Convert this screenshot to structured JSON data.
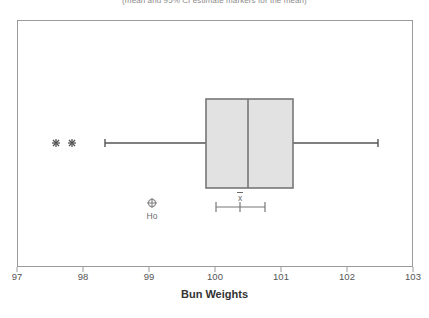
{
  "subtitle": "(mean and 95% CI estimate markers for the mean)",
  "axis": {
    "title": "Bun Weights",
    "ticks": [
      "97",
      "98",
      "99",
      "100",
      "101",
      "102",
      "103"
    ]
  },
  "annotations": {
    "ho_label": "Ho",
    "xbar_label": "x"
  },
  "colors": {
    "frame": "#9a9a9a",
    "box_fill": "#e2e2e2",
    "box_border": "#777777",
    "whisker": "#555555",
    "outlier": "#555555",
    "marker": "#8a8a8a",
    "text": "#555555"
  },
  "chart_data": {
    "type": "boxplot",
    "title": "",
    "subtitle": "(mean and 95% CI estimate markers for the mean)",
    "xlabel": "Bun Weights",
    "ylabel": "",
    "xlim": [
      97,
      103
    ],
    "xticks": [
      97,
      98,
      99,
      100,
      101,
      102,
      103
    ],
    "grid": false,
    "legend": "none",
    "orientation": "horizontal",
    "boxes": [
      {
        "name": "Bun Weights",
        "whisker_low": 98.33,
        "q1": 99.86,
        "median": 100.51,
        "q3": 101.18,
        "whisker_high": 102.47,
        "outliers": [
          97.59,
          97.83
        ],
        "mean": 100.38,
        "ci_low": 100.02,
        "ci_high": 100.76,
        "hypothesized_mean": 99.05
      }
    ],
    "markers": [
      {
        "label": "Ho",
        "x": 99.05,
        "type": "circle-cross",
        "note": "hypothesized mean marker"
      },
      {
        "label": "x",
        "x": 100.38,
        "type": "xbar",
        "note": "sample mean marker above 95% CI bar"
      }
    ]
  }
}
